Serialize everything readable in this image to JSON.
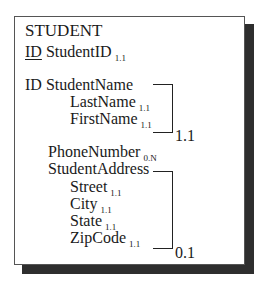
{
  "entity": {
    "name": "STUDENT",
    "attributes": [
      {
        "id_prefix": "ID",
        "id_underlined": true,
        "name": "StudentID",
        "cardinality": "1.1"
      },
      {
        "id_prefix": "ID",
        "id_underlined": false,
        "name": "StudentName",
        "group": true,
        "children": [
          {
            "name": "LastName",
            "cardinality": "1.1"
          },
          {
            "name": "FirstName",
            "cardinality": "1.1"
          }
        ],
        "group_cardinality": "1.1"
      },
      {
        "name": "PhoneNumber",
        "cardinality": "0.N"
      },
      {
        "name": "StudentAddress",
        "group": true,
        "children": [
          {
            "name": "Street",
            "cardinality": "1.1"
          },
          {
            "name": "City",
            "cardinality": "1.1"
          },
          {
            "name": "State",
            "cardinality": "1.1"
          },
          {
            "name": "ZipCode",
            "cardinality": "1.1"
          }
        ],
        "group_cardinality": "0.1"
      }
    ]
  },
  "colors": {
    "border": "#555555",
    "shadow": "#2e2e2e",
    "text": "#1a1a1a",
    "background": "#ffffff"
  }
}
